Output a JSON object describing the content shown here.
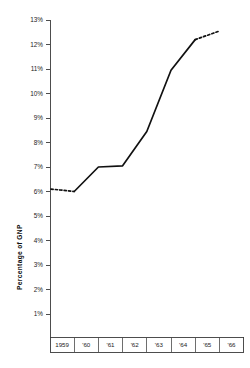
{
  "chart_data": {
    "type": "line",
    "title": "",
    "subtitle": "",
    "xlabel": "",
    "ylabel": "Percentage of GNP",
    "x": [
      "1959",
      "'60",
      "'61",
      "'62",
      "'63",
      "'64",
      "'65",
      "'66"
    ],
    "categories": [
      "1959",
      "'60",
      "'61",
      "'62",
      "'63",
      "'64",
      "'65",
      "'66"
    ],
    "values": [
      6.1,
      6.0,
      7.0,
      7.05,
      8.45,
      10.95,
      12.2,
      12.55
    ],
    "series": [
      {
        "name": "Percentage of GNP",
        "values": [
          6.1,
          6.0,
          7.0,
          7.05,
          8.45,
          10.95,
          12.2,
          12.55
        ],
        "style": "solid-with-dashed-ends",
        "dashed_segments": [
          "1959 to '60",
          "'65 to '66"
        ]
      }
    ],
    "ylim": [
      0,
      13
    ],
    "xlim": [
      "1959",
      "'66"
    ],
    "ytick_labels": [
      "1%",
      "2%",
      "3%",
      "4%",
      "5%",
      "6%",
      "7%",
      "8%",
      "9%",
      "10%",
      "11%",
      "12%",
      "13%"
    ],
    "ytick_values": [
      1,
      2,
      3,
      4,
      5,
      6,
      7,
      8,
      9,
      10,
      11,
      12,
      13
    ],
    "xtick_labels": [
      "1959",
      "'60",
      "'61",
      "'62",
      "'63",
      "'64",
      "'65",
      "'66"
    ],
    "grid": false,
    "legend": "none",
    "annotations": [],
    "line_color": "#111111",
    "axis_color": "#3a3a3a",
    "background_color": "#ffffff"
  },
  "axes": {
    "y_title": "Percentage of GNP",
    "y_ticks": [
      {
        "label": "13%",
        "value": 13
      },
      {
        "label": "12%",
        "value": 12
      },
      {
        "label": "11%",
        "value": 11
      },
      {
        "label": "10%",
        "value": 10
      },
      {
        "label": "9%",
        "value": 9
      },
      {
        "label": "8%",
        "value": 8
      },
      {
        "label": "7%",
        "value": 7
      },
      {
        "label": "6%",
        "value": 6
      },
      {
        "label": "5%",
        "value": 5
      },
      {
        "label": "4%",
        "value": 4
      },
      {
        "label": "3%",
        "value": 3
      },
      {
        "label": "2%",
        "value": 2
      },
      {
        "label": "1%",
        "value": 1
      }
    ],
    "x_ticks": [
      {
        "label": "1959"
      },
      {
        "label": "'60"
      },
      {
        "label": "'61"
      },
      {
        "label": "'62"
      },
      {
        "label": "'63"
      },
      {
        "label": "'64"
      },
      {
        "label": "'65"
      },
      {
        "label": "'66"
      }
    ]
  }
}
